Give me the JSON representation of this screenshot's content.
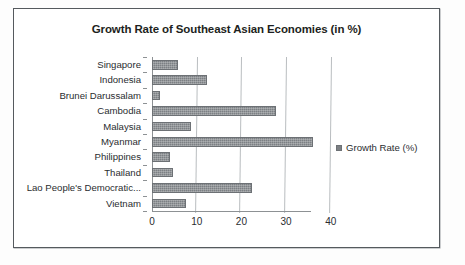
{
  "chart_data": {
    "type": "bar",
    "orientation": "horizontal",
    "title": "Growth Rate of Southeast Asian Economies (in %)",
    "xlabel": "",
    "ylabel": "",
    "xlim": [
      0,
      44
    ],
    "xticks": [
      0,
      10,
      20,
      30,
      40
    ],
    "xtick_labels": [
      "0",
      "10",
      "20",
      "30",
      "40"
    ],
    "grid": true,
    "grid_axis": "x",
    "legend": {
      "position": "right",
      "entries": [
        {
          "label": "Growth Rate (%)",
          "color": "#7c8084"
        }
      ]
    },
    "series_name": "Growth Rate (%)",
    "categories": [
      "Singapore",
      "Indonesia",
      "Brunei Darussalam",
      "Cambodia",
      "Malaysia",
      "Myanmar",
      "Philippines",
      "Thailand",
      "Lao People's Democratic...",
      "Vietnam"
    ],
    "values": [
      5.8,
      12.2,
      1.8,
      27.8,
      8.7,
      36.0,
      4.0,
      4.8,
      22.3,
      7.6
    ],
    "series": [
      {
        "name": "Growth Rate (%)",
        "color": "#7c8084",
        "values": [
          5.8,
          12.2,
          1.8,
          27.8,
          8.7,
          36.0,
          4.0,
          4.8,
          22.3,
          7.6
        ]
      }
    ]
  },
  "colors": {
    "bar": "#7c8084",
    "gridline": "#b9bdc0",
    "axis": "#8d9194",
    "border": "#555a5e",
    "text": "#2a2d30",
    "background": "#ffffff"
  }
}
